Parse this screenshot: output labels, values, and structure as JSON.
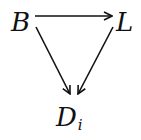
{
  "diagram": {
    "type": "commutative-diagram",
    "nodes": [
      {
        "id": "B",
        "label": "B",
        "subscript": ""
      },
      {
        "id": "L",
        "label": "L",
        "subscript": ""
      },
      {
        "id": "D",
        "label": "D",
        "subscript": "i"
      }
    ],
    "edges": [
      {
        "from": "B",
        "to": "L"
      },
      {
        "from": "B",
        "to": "D"
      },
      {
        "from": "L",
        "to": "D"
      }
    ],
    "colors": {
      "ink": "#111111",
      "background": "#ffffff"
    }
  }
}
